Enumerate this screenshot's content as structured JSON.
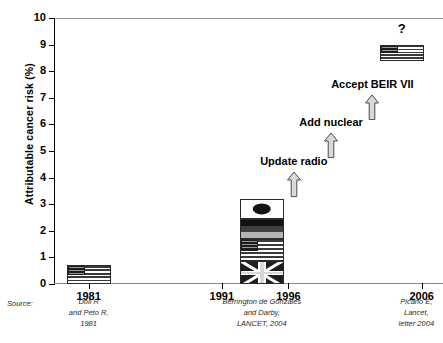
{
  "chart_data": {
    "type": "bar",
    "title": "",
    "xlabel": "",
    "ylabel": "Attributable cancer risk (%)",
    "ylim": [
      0,
      10
    ],
    "ytick_labels": [
      "0",
      "1",
      "2",
      "3",
      "4",
      "5",
      "6",
      "7",
      "8",
      "9",
      "10"
    ],
    "ytick_values": [
      0,
      1,
      2,
      3,
      4,
      5,
      6,
      7,
      8,
      9,
      10
    ],
    "xtick_labels": [
      "1981",
      "1991",
      "1996",
      "2006"
    ],
    "xtick_values": [
      1981,
      1991,
      1996,
      2006
    ],
    "grid": false,
    "legend": "none",
    "categories": [
      "1981",
      "2004",
      "2006"
    ],
    "values": [
      0.7,
      3.2,
      9.0
    ],
    "bars": [
      {
        "year": "1981",
        "x_value": 1981,
        "top_value": 0.7,
        "bottom_value": 0.0,
        "fill": "us-flag",
        "segments": [
          {
            "flag": "us-flag",
            "from": 0.0,
            "to": 0.7
          }
        ]
      },
      {
        "year": "2004",
        "x_value": 1994,
        "top_value": 3.2,
        "bottom_value": 0.0,
        "fill": "stacked-flags",
        "segments": [
          {
            "flag": "japan-flag",
            "from": 2.45,
            "to": 3.2
          },
          {
            "flag": "germany-flag",
            "from": 1.7,
            "to": 2.45
          },
          {
            "flag": "us-flag",
            "from": 0.85,
            "to": 1.7
          },
          {
            "flag": "uk-flag",
            "from": 0.0,
            "to": 0.85
          }
        ]
      },
      {
        "year": "2006",
        "x_value": 2004.5,
        "top_value": 9.0,
        "bottom_value": 8.4,
        "fill": "us-flag",
        "marker_label": "?",
        "marker_value": 9.6,
        "segments": [
          {
            "flag": "us-flag",
            "from": 8.4,
            "to": 9.0
          }
        ]
      }
    ],
    "annotations": [
      {
        "label": "Update radio",
        "label_value": 4.55,
        "arrow_from": 3.25,
        "arrow_to": 4.25,
        "x_value": 1996.4
      },
      {
        "label": "Add nuclear",
        "label_value": 6.0,
        "arrow_from": 4.7,
        "arrow_to": 5.7,
        "x_value": 1999.2
      },
      {
        "label": "Accept BEIR VII",
        "label_value": 7.45,
        "arrow_from": 6.15,
        "arrow_to": 7.15,
        "x_value": 2002.3
      }
    ],
    "source_word": "Source:",
    "sources": [
      {
        "text": "Doll R\nand Peto R,\n1981",
        "x_value": 1981,
        "lines": [
          "Doll R",
          "and Peto R,",
          "1981"
        ]
      },
      {
        "text": "Berrington de Gonzales\nand Darby,\nLANCET, 2004",
        "x_value": 1994,
        "lines": [
          "Berrington de Gonzales",
          "and Darby,",
          "LANCET, 2004"
        ]
      },
      {
        "text": "Picano E,\nLancet,\nletter 2004",
        "x_value": 2005.6,
        "lines": [
          "Picano E,",
          "Lancet,",
          "letter 2004"
        ]
      }
    ]
  },
  "colors": {
    "axis": "#000000",
    "frame": "#9a9a9a",
    "text": "#000000",
    "source_text": "#2b2b2b",
    "arrow_fill": "#d9d9d9",
    "arrow_stroke": "#4a4a4a"
  }
}
